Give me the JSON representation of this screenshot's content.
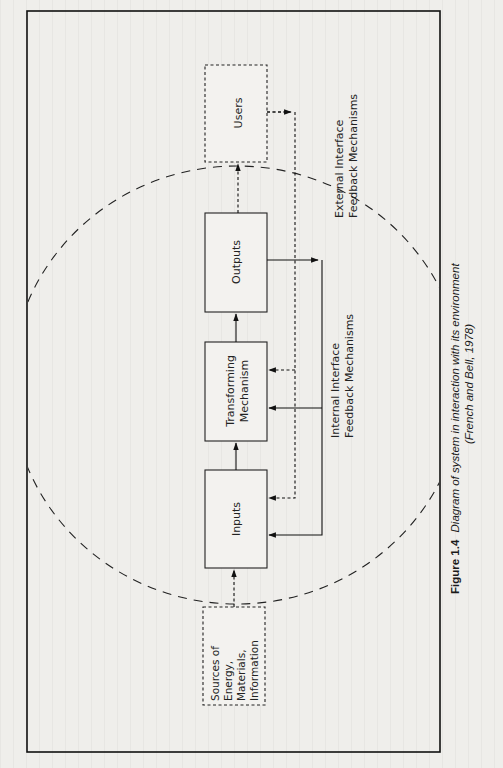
{
  "figure": {
    "number": "Figure 1.4",
    "title": "Diagram of system in interaction with its environment",
    "source": "(French and Bell, 1978)"
  },
  "nodes": {
    "users": {
      "label": "Users",
      "style": "dashed"
    },
    "outputs": {
      "label": "Outputs",
      "style": "solid"
    },
    "transforming": {
      "line1": "Transforming",
      "line2": "Mechanism",
      "style": "solid"
    },
    "inputs": {
      "label": "Inputs",
      "style": "solid"
    },
    "sources": {
      "line1": "Sources of",
      "line2": "Energy,",
      "line3": "Materials,",
      "line4": "Information",
      "style": "dashed"
    }
  },
  "labels": {
    "external": {
      "line1": "External Interface",
      "line2": "Feedback Mechanisms"
    },
    "internal": {
      "line1": "Internal Interface",
      "line2": "Feedback Mechanisms"
    }
  },
  "edges": [
    {
      "from": "sources",
      "to": "inputs",
      "style": "dashed"
    },
    {
      "from": "inputs",
      "to": "transforming",
      "style": "solid"
    },
    {
      "from": "transforming",
      "to": "outputs",
      "style": "solid"
    },
    {
      "from": "outputs",
      "to": "users",
      "style": "dashed"
    },
    {
      "from": "outputs",
      "to": "transforming",
      "style": "solid",
      "type": "internal feedback"
    },
    {
      "from": "outputs",
      "to": "inputs",
      "style": "solid",
      "type": "internal feedback"
    },
    {
      "from": "users",
      "to": "transforming",
      "style": "dashed",
      "type": "external feedback"
    },
    {
      "from": "users",
      "to": "inputs",
      "style": "dashed",
      "type": "external feedback"
    }
  ],
  "boundary": {
    "style": "dashed",
    "shape": "ellipse",
    "meaning": "system boundary"
  }
}
